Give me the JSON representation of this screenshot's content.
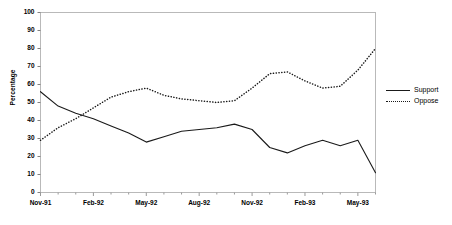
{
  "chart_data": {
    "type": "line",
    "title": "",
    "xlabel": "",
    "ylabel": "Percentage",
    "ylim": [
      0,
      100
    ],
    "ytick_step": 10,
    "yticks": [
      0,
      10,
      20,
      30,
      40,
      50,
      60,
      70,
      80,
      90,
      100
    ],
    "grid": false,
    "legend_position": "right",
    "x": [
      "Nov-91",
      "Dec-91",
      "Jan-92",
      "Feb-92",
      "Mar-92",
      "Apr-92",
      "May-92",
      "Jun-92",
      "Jul-92",
      "Aug-92",
      "Sep-92",
      "Oct-92",
      "Nov-92",
      "Dec-92",
      "Jan-93",
      "Feb-93",
      "Mar-93",
      "Apr-93",
      "May-93",
      "Jun-93"
    ],
    "xtick_labels": [
      "Nov-91",
      "Feb-92",
      "May-92",
      "Aug-92",
      "Nov-92",
      "Feb-93",
      "May-93"
    ],
    "series": [
      {
        "name": "Support",
        "style": "solid",
        "color": "#1a1a1a",
        "values": [
          56,
          48,
          44,
          41,
          37,
          33,
          28,
          31,
          34,
          35,
          36,
          38,
          35,
          25,
          22,
          26,
          29,
          26,
          29,
          11
        ]
      },
      {
        "name": "Oppose",
        "style": "dotted",
        "color": "#1a1a1a",
        "values": [
          29,
          36,
          41,
          47,
          53,
          56,
          58,
          54,
          52,
          51,
          50,
          51,
          58,
          66,
          67,
          62,
          58,
          59,
          68,
          80
        ]
      }
    ]
  },
  "legend": {
    "items": [
      {
        "label": "Support",
        "style": "solid"
      },
      {
        "label": "Oppose",
        "style": "dotted"
      }
    ]
  }
}
